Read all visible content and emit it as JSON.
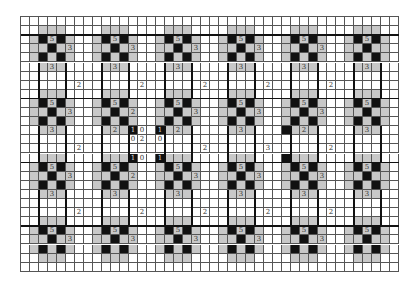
{
  "puzzle": {
    "type": "slitherlink-style grid",
    "rows": 28,
    "cols": 42,
    "motif": {
      "period": 7,
      "origin_rows": [
        2,
        9,
        16,
        23
      ],
      "origin_cols": [
        2,
        9,
        16,
        23,
        30,
        37
      ],
      "black_offsets": [
        [
          0,
          0
        ],
        [
          0,
          2
        ],
        [
          1,
          1
        ],
        [
          2,
          0
        ],
        [
          2,
          2
        ]
      ],
      "gray_offsets": [
        [
          -1,
          0
        ],
        [
          -1,
          1
        ],
        [
          -1,
          2
        ],
        [
          0,
          -1
        ],
        [
          1,
          -1
        ],
        [
          2,
          -1
        ],
        [
          0,
          3
        ],
        [
          1,
          3
        ],
        [
          2,
          3
        ],
        [
          3,
          0
        ],
        [
          3,
          1
        ],
        [
          3,
          2
        ],
        [
          1,
          0
        ],
        [
          1,
          2
        ],
        [
          0,
          1
        ],
        [
          2,
          1
        ]
      ],
      "top_clue": "5",
      "right_clue": "3",
      "bottom_clue": "3"
    },
    "extra_black": [
      [
        12,
        12
      ],
      [
        12,
        15
      ],
      [
        15,
        12
      ],
      [
        15,
        15
      ],
      [
        12,
        29
      ],
      [
        15,
        29
      ]
    ],
    "clues": [
      {
        "r": 7,
        "c": 6,
        "v": "2"
      },
      {
        "r": 7,
        "c": 13,
        "v": "2"
      },
      {
        "r": 7,
        "c": 20,
        "v": "2"
      },
      {
        "r": 7,
        "c": 27,
        "v": "2"
      },
      {
        "r": 7,
        "c": 34,
        "v": "2"
      },
      {
        "r": 14,
        "c": 6,
        "v": "2"
      },
      {
        "r": 14,
        "c": 20,
        "v": "2"
      },
      {
        "r": 14,
        "c": 27,
        "v": "3"
      },
      {
        "r": 14,
        "c": 34,
        "v": "2"
      },
      {
        "r": 21,
        "c": 6,
        "v": "2"
      },
      {
        "r": 21,
        "c": 13,
        "v": "2"
      },
      {
        "r": 21,
        "c": 20,
        "v": "2"
      },
      {
        "r": 21,
        "c": 27,
        "v": "2"
      },
      {
        "r": 21,
        "c": 34,
        "v": "2"
      },
      {
        "r": 12,
        "c": 12,
        "v": "1"
      },
      {
        "r": 12,
        "c": 13,
        "v": "0"
      },
      {
        "r": 12,
        "c": 15,
        "v": "1"
      },
      {
        "r": 13,
        "c": 12,
        "v": "0"
      },
      {
        "r": 13,
        "c": 13,
        "v": "2"
      },
      {
        "r": 13,
        "c": 15,
        "v": "0"
      },
      {
        "r": 15,
        "c": 12,
        "v": "1"
      },
      {
        "r": 15,
        "c": 13,
        "v": "0"
      },
      {
        "r": 15,
        "c": 15,
        "v": "1"
      }
    ],
    "overrides": [
      {
        "r": 10,
        "c": 12,
        "v": "2"
      },
      {
        "r": 12,
        "c": 10,
        "v": "2"
      },
      {
        "r": 12,
        "c": 17,
        "v": "2"
      },
      {
        "r": 17,
        "c": 12,
        "v": "2"
      },
      {
        "r": 12,
        "c": 31,
        "v": "2"
      }
    ],
    "suppressed_right_clue_cols": [
      37
    ],
    "suppressed_bottom_clue_rows": [
      23
    ]
  }
}
